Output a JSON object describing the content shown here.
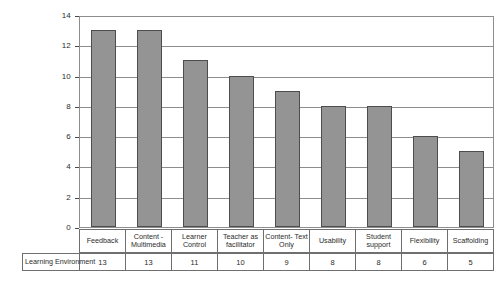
{
  "chart_data": {
    "type": "bar",
    "title": "",
    "xlabel": "",
    "ylabel": "",
    "ylim": [
      0,
      14
    ],
    "ytick_labels": [
      "14",
      "12",
      "10",
      "8",
      "6",
      "4",
      "2",
      "0"
    ],
    "yticks": [
      14,
      12,
      10,
      8,
      6,
      4,
      2,
      0
    ],
    "grid": true,
    "legend_position": "none",
    "series_name": "Learning Environment",
    "categories": [
      "Feedback",
      "Content - Multimedia",
      "Learner Control",
      "Teacher as facilitator",
      "Content- Text Only",
      "Usability",
      "Student support",
      "Flexibility",
      "Scaffolding"
    ],
    "values": [
      13,
      13,
      11,
      10,
      9,
      8,
      8,
      6,
      5
    ],
    "value_labels": [
      "13",
      "13",
      "11",
      "10",
      "9",
      "8",
      "8",
      "6",
      "5"
    ],
    "series": [
      {
        "name": "Learning Environment",
        "values": [
          13,
          13,
          11,
          10,
          9,
          8,
          8,
          6,
          5
        ]
      }
    ],
    "bar_color": "#949494",
    "bar_edge_color": "#4d4d4d",
    "grid_color": "#8d8d8d",
    "axis_color": "#4a4a4a",
    "background_color": "#ffffff"
  }
}
